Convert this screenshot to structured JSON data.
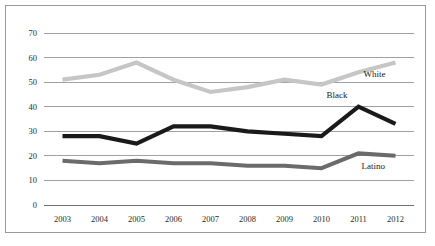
{
  "chart_data": {
    "type": "line",
    "title": "",
    "subtitle": "",
    "xlabel": "",
    "ylabel": "",
    "categories": [
      "2003",
      "2004",
      "2005",
      "2006",
      "2007",
      "2008",
      "2009",
      "2010",
      "2011",
      "2012"
    ],
    "ylim": [
      0,
      70
    ],
    "y_ticks": [
      "0",
      "10",
      "20",
      "30",
      "40",
      "50",
      "60",
      "70"
    ],
    "y_tick_values": [
      0,
      10,
      20,
      30,
      40,
      50,
      60,
      70
    ],
    "grid": "horizontal",
    "legend_position": "inline-right",
    "series": [
      {
        "name": "White",
        "color": "#c6c6c6",
        "values": [
          51,
          53,
          58,
          51,
          46,
          48,
          51,
          49,
          54,
          58
        ]
      },
      {
        "name": "Black",
        "color": "#1a1a1a",
        "values": [
          28,
          28,
          25,
          32,
          32,
          30,
          29,
          28,
          40,
          33
        ]
      },
      {
        "name": "Latino",
        "color": "#6b6b6b",
        "values": [
          18,
          17,
          18,
          17,
          17,
          16,
          16,
          15,
          21,
          20
        ]
      }
    ],
    "annotations": [
      {
        "text": "White",
        "series": "White",
        "value_at": 2012
      },
      {
        "text": "Black",
        "series": "Black",
        "value_at": 2011
      },
      {
        "text": "Latino",
        "series": "Latino",
        "value_at": 2012
      }
    ]
  },
  "axis": {
    "y_labels": [
      "70",
      "60",
      "50",
      "40",
      "30",
      "20",
      "10",
      "0"
    ],
    "x_labels": [
      "2003",
      "2004",
      "2005",
      "2006",
      "2007",
      "2008",
      "2009",
      "2010",
      "2011",
      "2012"
    ]
  },
  "labels": {
    "white": "White",
    "black": "Black",
    "latino": "Latino"
  },
  "colors": {
    "white_series": "#c6c6c6",
    "black_series": "#1a1a1a",
    "latino_series": "#6b6b6b",
    "gridline": "#8a8a8a",
    "frame": "#9a9a9a",
    "background": "#ffffff"
  }
}
